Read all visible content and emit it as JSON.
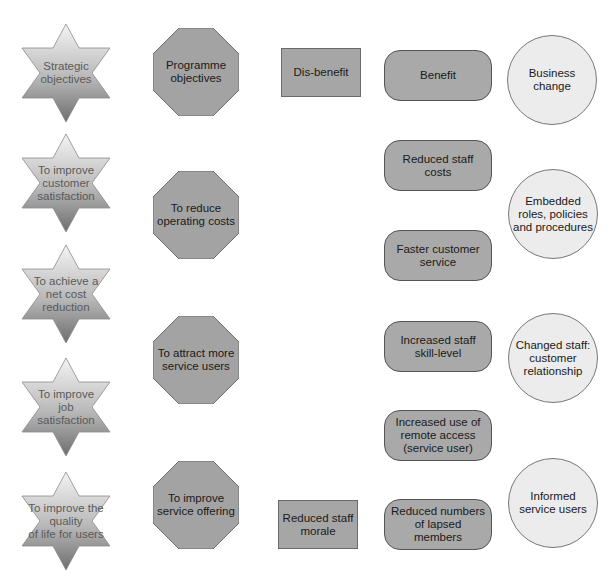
{
  "colors": {
    "star_gradient_top": "#f2f2f2",
    "star_gradient_bottom": "#7a7a7a",
    "octagon_fill": "#a3a3a3",
    "rect_fill": "#a6a6a6",
    "benefit_fill": "#a9a9a9",
    "circle_fill": "#ececec"
  },
  "legend": {
    "strategic": "Strategic\nobjectives",
    "programme": "Programme\nobjectives",
    "disbenefit": "Dis-benefit",
    "benefit": "Benefit",
    "business_change": "Business\nchange"
  },
  "strategic_objectives": [
    "To improve\ncustomer\nsatisfaction",
    "To achieve a\nnet cost\nreduction",
    "To improve\njob\nsatisfaction",
    "To improve the\nquality\nof life for users"
  ],
  "programme_objectives": [
    "To reduce\noperating costs",
    "To attract more\nservice users",
    "To improve\nservice offering"
  ],
  "disbenefits": [
    "Reduced staff\nmorale"
  ],
  "benefits": [
    "Reduced staff\ncosts",
    "Faster customer\nservice",
    "Increased staff\nskill-level",
    "Increased use of\nremote access\n(service user)",
    "Reduced numbers\nof lapsed\nmembers"
  ],
  "business_changes": [
    "Embedded\nroles, policies\nand procedures",
    "Changed staff:\ncustomer\nrelationship",
    "Informed\nservice users"
  ]
}
